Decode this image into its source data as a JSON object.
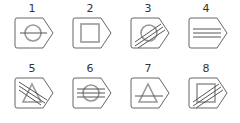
{
  "figure": {
    "items": [
      {
        "label": "1",
        "outer": "pentagon-tag",
        "inner": "circle",
        "lines": "horizontal-single"
      },
      {
        "label": "2",
        "outer": "pentagon-tag",
        "inner": "square",
        "lines": "none"
      },
      {
        "label": "3",
        "outer": "pentagon-tag",
        "inner": "circle",
        "lines": "diagonal-triple"
      },
      {
        "label": "4",
        "outer": "pentagon-tag",
        "inner": "none",
        "lines": "horizontal-triple"
      },
      {
        "label": "5",
        "outer": "pentagon-tag",
        "inner": "triangle",
        "lines": "diagonal-triple-down"
      },
      {
        "label": "6",
        "outer": "pentagon-tag",
        "inner": "circle",
        "lines": "horizontal-triple"
      },
      {
        "label": "7",
        "outer": "pentagon-tag",
        "inner": "triangle",
        "lines": "horizontal-single"
      },
      {
        "label": "8",
        "outer": "pentagon-tag",
        "inner": "square",
        "lines": "diagonal-triple"
      }
    ],
    "colors": {
      "outline": "#666666",
      "inner": "#999999",
      "lines": "#555555"
    }
  }
}
